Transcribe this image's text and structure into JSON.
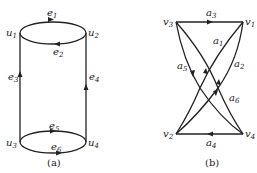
{
  "figure_a": {
    "caption": "(a)",
    "vertices": [
      {
        "id": "u1",
        "base": "u",
        "sub": "1"
      },
      {
        "id": "u2",
        "base": "u",
        "sub": "2"
      },
      {
        "id": "u3",
        "base": "u",
        "sub": "3"
      },
      {
        "id": "u4",
        "base": "u",
        "sub": "4"
      }
    ],
    "edges": [
      {
        "id": "e1",
        "base": "e",
        "sub": "1",
        "from": "u1",
        "to": "u2"
      },
      {
        "id": "e2",
        "base": "e",
        "sub": "2",
        "from": "u2",
        "to": "u1"
      },
      {
        "id": "e3",
        "base": "e",
        "sub": "3",
        "from": "u3",
        "to": "u1"
      },
      {
        "id": "e4",
        "base": "e",
        "sub": "4",
        "from": "u4",
        "to": "u2"
      },
      {
        "id": "e5",
        "base": "e",
        "sub": "5",
        "from": "u3",
        "to": "u4"
      },
      {
        "id": "e6",
        "base": "e",
        "sub": "6",
        "from": "u3",
        "to": "u4"
      }
    ]
  },
  "figure_b": {
    "caption": "(b)",
    "vertices": [
      {
        "id": "v1",
        "base": "v",
        "sub": "1"
      },
      {
        "id": "v2",
        "base": "v",
        "sub": "2"
      },
      {
        "id": "v3",
        "base": "v",
        "sub": "3"
      },
      {
        "id": "v4",
        "base": "v",
        "sub": "4"
      }
    ],
    "edges": [
      {
        "id": "a1",
        "base": "a",
        "sub": "1",
        "from": "v2",
        "to": "v1"
      },
      {
        "id": "a2",
        "base": "a",
        "sub": "2",
        "from": "v1",
        "to": "v2"
      },
      {
        "id": "a3",
        "base": "a",
        "sub": "3",
        "from": "v3",
        "to": "v1"
      },
      {
        "id": "a4",
        "base": "a",
        "sub": "4",
        "from": "v4",
        "to": "v2"
      },
      {
        "id": "a5",
        "base": "a",
        "sub": "5",
        "from": "v3",
        "to": "v4"
      },
      {
        "id": "a6",
        "base": "a",
        "sub": "6",
        "from": "v4",
        "to": "v3"
      }
    ]
  }
}
